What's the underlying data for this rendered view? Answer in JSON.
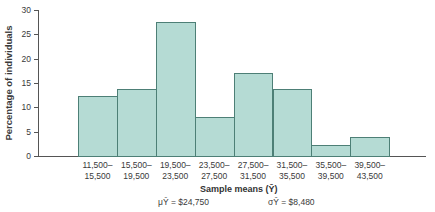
{
  "chart_data": {
    "type": "bar",
    "title": "",
    "xlabel": "Sample means (Ȳ)",
    "ylabel": "Percentage of individuals",
    "ylim": [
      0,
      30
    ],
    "yticks": [
      "0",
      "5",
      "10",
      "15",
      "20",
      "25",
      "30"
    ],
    "grid": false,
    "categories": [
      "11,500–15,500",
      "15,500–19,500",
      "19,500–23,500",
      "23,500–27,500",
      "27,500–31,500",
      "31,500–35,500",
      "35,500–39,500",
      "39,500–43,500"
    ],
    "category_lines": [
      [
        "11,500–",
        "15,500"
      ],
      [
        "15,500–",
        "19,500"
      ],
      [
        "19,500–",
        "23,500"
      ],
      [
        "23,500–",
        "27,500"
      ],
      [
        "27,500–",
        "31,500"
      ],
      [
        "31,500–",
        "35,500"
      ],
      [
        "35,500–",
        "39,500"
      ],
      [
        "39,500–",
        "43,500"
      ]
    ],
    "values": [
      12.3,
      13.8,
      27.5,
      8.0,
      17.0,
      13.8,
      2.3,
      4.0
    ],
    "annotations": {
      "mean": "μȲ = $24,750",
      "sd": "σȲ = $8,480"
    },
    "colors": {
      "bar_fill": "#b5dbd4",
      "bar_edge": "#4d7f76"
    }
  }
}
